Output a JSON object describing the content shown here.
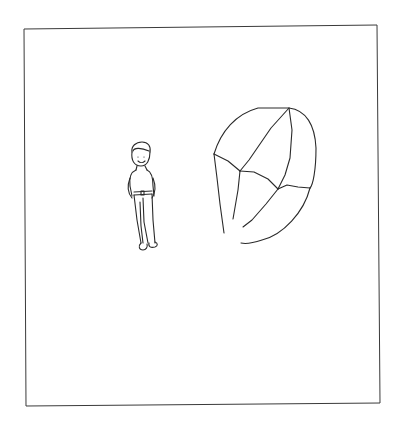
{
  "drawing": {
    "description": "Line drawing of a small standing boy beside a large faceted crystal/rock inside a rectangular frame",
    "elements": [
      "frame",
      "boy-figure",
      "crystal"
    ],
    "stroke_color": "#2a2a2a",
    "background_color": "#ffffff"
  }
}
